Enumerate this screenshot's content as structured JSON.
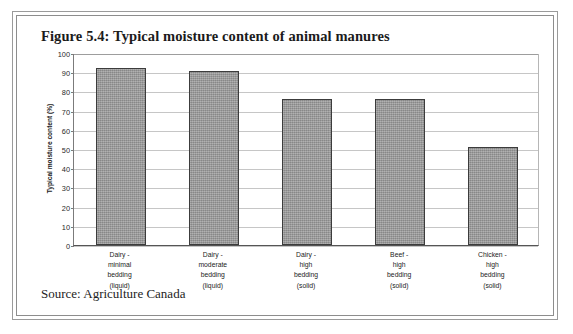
{
  "figure": {
    "title": "Figure 5.4: Typical moisture content of animal manures",
    "source": "Source:  Agriculture Canada"
  },
  "chart_data": {
    "type": "bar",
    "title": "Figure 5.4: Typical moisture content of animal manures",
    "xlabel": "",
    "ylabel": "Typical moisture content (%)",
    "ylim": [
      0,
      100
    ],
    "ytick_step": 10,
    "yticks": [
      100,
      90,
      80,
      70,
      60,
      50,
      40,
      30,
      20,
      10,
      0
    ],
    "grid": true,
    "legend": false,
    "bar_color": "#9b9b9b",
    "bar_edge_color": "#3c3c3c",
    "categories": [
      "Dairy -\nminimal\nbedding\n(liquid)",
      "Dairy -\nmoderate\nbedding\n(liquid)",
      "Dairy -\nhigh\nbedding\n(solid)",
      "Beef -\nhigh\nbedding\n(solid)",
      "Chicken -\nhigh\nbedding\n(solid)"
    ],
    "category_lines": [
      [
        "Dairy -",
        "minimal",
        "bedding",
        "(liquid)"
      ],
      [
        "Dairy -",
        "moderate",
        "bedding",
        "(liquid)"
      ],
      [
        "Dairy -",
        "high",
        "bedding",
        "(solid)"
      ],
      [
        "Beef -",
        "high",
        "bedding",
        "(solid)"
      ],
      [
        "Chicken -",
        "high",
        "bedding",
        "(solid)"
      ]
    ],
    "values": [
      92,
      90.5,
      76,
      76,
      51
    ]
  }
}
